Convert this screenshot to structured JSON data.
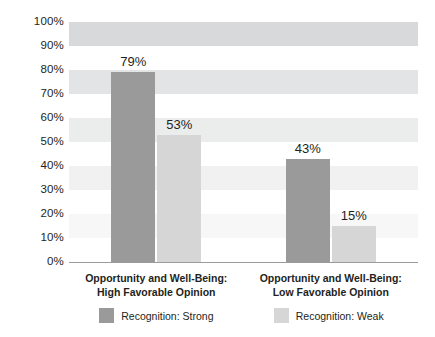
{
  "chart_data": {
    "type": "bar",
    "title": "",
    "subtitle": "",
    "xlabel": "",
    "ylabel": "",
    "ylim": [
      0,
      100
    ],
    "grid": "horizontal-bands",
    "legend_position": "bottom",
    "value_suffix": "%",
    "categories": [
      "Opportunity and Well-Being: High Favorable Opinion",
      "Opportunity and Well-Being: Low Favorable Opinion"
    ],
    "category_lines": [
      [
        "Opportunity and Well-Being:",
        "High Favorable Opinion"
      ],
      [
        "Opportunity and Well-Being:",
        "Low Favorable Opinion"
      ]
    ],
    "series": [
      {
        "name": "Recognition: Strong",
        "color": "#9a9a9a",
        "values": [
          79,
          43
        ],
        "value_labels": [
          "79%",
          "43%"
        ]
      },
      {
        "name": "Recognition: Weak",
        "color": "#d6d6d6",
        "values": [
          53,
          15
        ],
        "value_labels": [
          "53%",
          "15%"
        ]
      }
    ],
    "y_ticks": [
      {
        "value": 100,
        "label": "100%"
      },
      {
        "value": 90,
        "label": "90%"
      },
      {
        "value": 80,
        "label": "80%"
      },
      {
        "value": 70,
        "label": "70%"
      },
      {
        "value": 60,
        "label": "60%"
      },
      {
        "value": 50,
        "label": "50%"
      },
      {
        "value": 40,
        "label": "40%"
      },
      {
        "value": 30,
        "label": "30%"
      },
      {
        "value": 20,
        "label": "20%"
      },
      {
        "value": 10,
        "label": "10%"
      },
      {
        "value": 0,
        "label": "0%"
      }
    ],
    "bands": [
      {
        "from": 90,
        "to": 100,
        "color": "#d8d9da"
      },
      {
        "from": 70,
        "to": 80,
        "color": "#e3e4e5"
      },
      {
        "from": 50,
        "to": 60,
        "color": "#ebecec"
      },
      {
        "from": 30,
        "to": 40,
        "color": "#f1f1f2"
      },
      {
        "from": 10,
        "to": 20,
        "color": "#f7f7f8"
      }
    ],
    "legend": [
      {
        "label": "Recognition: Strong",
        "color": "#9a9a9a"
      },
      {
        "label": "Recognition: Weak",
        "color": "#d6d6d6"
      }
    ]
  }
}
